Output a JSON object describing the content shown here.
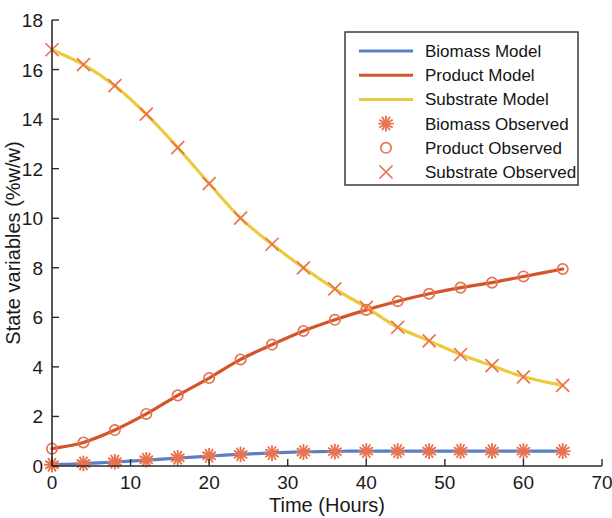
{
  "chart_data": {
    "type": "line",
    "title": "",
    "xlabel": "Time (Hours)",
    "ylabel": "State variables (%w/w)",
    "xlim": [
      0,
      70
    ],
    "ylim": [
      0,
      18
    ],
    "xticks": [
      0,
      10,
      20,
      30,
      40,
      50,
      60,
      70
    ],
    "yticks": [
      0,
      2,
      4,
      6,
      8,
      10,
      12,
      14,
      16,
      18
    ],
    "grid": false,
    "legend_position": "upper right",
    "colors": {
      "biomass_model": "#5B7FC7",
      "product_model": "#D4542A",
      "substrate_model": "#EDC93C",
      "observed_marker": "#E8734E",
      "axis": "#2b2b2b",
      "background": "#ffffff"
    },
    "series": [
      {
        "name": "Biomass Model",
        "kind": "line",
        "color": "#5B7FC7",
        "x": [
          0,
          2,
          4,
          6,
          8,
          10,
          12,
          14,
          16,
          18,
          20,
          22,
          24,
          26,
          28,
          30,
          32,
          34,
          36,
          38,
          40,
          44,
          48,
          52,
          56,
          60,
          65
        ],
        "values": [
          0.05,
          0.07,
          0.1,
          0.13,
          0.16,
          0.2,
          0.24,
          0.28,
          0.32,
          0.36,
          0.4,
          0.44,
          0.47,
          0.5,
          0.53,
          0.55,
          0.57,
          0.58,
          0.59,
          0.6,
          0.6,
          0.6,
          0.6,
          0.6,
          0.6,
          0.6,
          0.6
        ]
      },
      {
        "name": "Product Model",
        "kind": "line",
        "color": "#D4542A",
        "x": [
          0,
          4,
          8,
          12,
          16,
          20,
          24,
          28,
          32,
          36,
          40,
          44,
          48,
          52,
          56,
          60,
          65
        ],
        "values": [
          0.7,
          0.95,
          1.45,
          2.1,
          2.85,
          3.55,
          4.3,
          4.9,
          5.45,
          5.9,
          6.3,
          6.65,
          6.95,
          7.2,
          7.4,
          7.65,
          7.95
        ]
      },
      {
        "name": "Substrate Model",
        "kind": "line",
        "color": "#EDC93C",
        "x": [
          0,
          4,
          8,
          12,
          16,
          20,
          24,
          28,
          32,
          36,
          40,
          44,
          48,
          52,
          56,
          60,
          65
        ],
        "values": [
          16.8,
          16.2,
          15.35,
          14.2,
          12.85,
          11.4,
          10.0,
          8.95,
          8.0,
          7.15,
          6.4,
          5.6,
          5.05,
          4.5,
          4.05,
          3.6,
          3.25
        ]
      },
      {
        "name": "Biomass Observed",
        "kind": "scatter",
        "marker": "asterisk",
        "color": "#E8734E",
        "x": [
          0,
          4,
          8,
          12,
          16,
          20,
          24,
          28,
          32,
          36,
          40,
          44,
          48,
          52,
          56,
          60,
          65
        ],
        "values": [
          0.05,
          0.1,
          0.17,
          0.25,
          0.33,
          0.41,
          0.47,
          0.52,
          0.56,
          0.58,
          0.6,
          0.6,
          0.6,
          0.6,
          0.6,
          0.6,
          0.6
        ]
      },
      {
        "name": "Product Observed",
        "kind": "scatter",
        "marker": "circle",
        "color": "#E8734E",
        "x": [
          0,
          4,
          8,
          12,
          16,
          20,
          24,
          28,
          32,
          36,
          40,
          44,
          48,
          52,
          56,
          60,
          65
        ],
        "values": [
          0.7,
          0.95,
          1.45,
          2.1,
          2.85,
          3.55,
          4.3,
          4.9,
          5.45,
          5.9,
          6.3,
          6.65,
          6.95,
          7.2,
          7.4,
          7.65,
          7.95
        ]
      },
      {
        "name": "Substrate Observed",
        "kind": "scatter",
        "marker": "x",
        "color": "#E8734E",
        "x": [
          0,
          4,
          8,
          12,
          16,
          20,
          24,
          28,
          32,
          36,
          40,
          44,
          48,
          52,
          56,
          60,
          65
        ],
        "values": [
          16.8,
          16.2,
          15.35,
          14.2,
          12.85,
          11.4,
          10.0,
          8.95,
          8.0,
          7.15,
          6.4,
          5.6,
          5.05,
          4.5,
          4.05,
          3.6,
          3.25
        ]
      }
    ],
    "legend_entries": [
      {
        "label": "Biomass Model",
        "style": "line",
        "color": "#5B7FC7"
      },
      {
        "label": "Product Model",
        "style": "line",
        "color": "#D4542A"
      },
      {
        "label": "Substrate Model",
        "style": "line",
        "color": "#EDC93C"
      },
      {
        "label": "Biomass Observed",
        "style": "asterisk",
        "color": "#E8734E"
      },
      {
        "label": "Product Observed",
        "style": "circle",
        "color": "#E8734E"
      },
      {
        "label": "Substrate Observed",
        "style": "x",
        "color": "#E8734E"
      }
    ]
  }
}
